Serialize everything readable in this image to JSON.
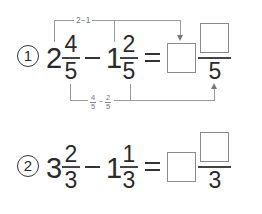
{
  "problems": [
    {
      "number": "1",
      "whole1": "2",
      "numerator1": "4",
      "denominator1": "5",
      "operator": "−",
      "whole2": "1",
      "numerator2": "2",
      "denominator2": "5",
      "equals": "=",
      "answer_whole": "",
      "answer_numerator": "",
      "answer_denominator": "5",
      "hint_top": "2−1",
      "hint_bottom": {
        "frac1_num": "4",
        "frac1_den": "5",
        "operator": "−",
        "frac2_num": "2",
        "frac2_den": "5"
      }
    },
    {
      "number": "2",
      "whole1": "3",
      "numerator1": "2",
      "denominator1": "3",
      "operator": "−",
      "whole2": "1",
      "numerator2": "1",
      "denominator2": "3",
      "equals": "=",
      "answer_whole": "",
      "answer_numerator": "",
      "answer_denominator": "3"
    }
  ]
}
